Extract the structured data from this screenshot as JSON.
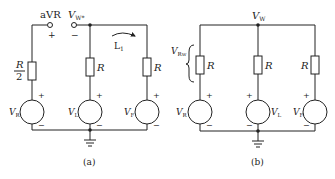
{
  "figure": {
    "panels": [
      {
        "id": "a",
        "caption": "(a)",
        "terminal_left_label": "aVR",
        "terminal_right_label_main": "V",
        "terminal_right_label_sub": "W*",
        "terminal_left_sign": "+",
        "terminal_right_sign": "−",
        "loop_label_main": "L",
        "loop_label_sub": "1",
        "resistor_left_label_num": "R",
        "resistor_left_label_den": "2",
        "resistor_mid_label": "R",
        "resistor_right_label": "R",
        "sources": [
          {
            "main": "V",
            "sub": "R",
            "plus": "+",
            "minus": "−"
          },
          {
            "main": "V",
            "sub": "L",
            "plus": "+",
            "minus": "−"
          },
          {
            "main": "V",
            "sub": "F",
            "plus": "+",
            "minus": "−"
          }
        ]
      },
      {
        "id": "b",
        "caption": "(b)",
        "node_label_main": "V",
        "node_label_sub": "W",
        "brace_label_main": "V",
        "brace_label_sub": "Rw",
        "resistor_labels": [
          "R",
          "R",
          "R"
        ],
        "sources": [
          {
            "main": "V",
            "sub": "R",
            "plus": "+",
            "minus": "−"
          },
          {
            "main": "V",
            "sub": "L",
            "plus": "+",
            "minus": "−"
          },
          {
            "main": "V",
            "sub": "F",
            "plus": "+",
            "minus": "−"
          }
        ]
      }
    ]
  }
}
